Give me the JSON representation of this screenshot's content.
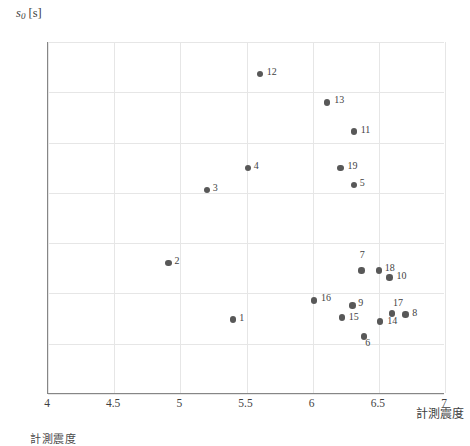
{
  "chart_data": {
    "type": "scatter",
    "title": "",
    "xlabel": "計測震度",
    "ylabel": "s0 [s]",
    "ylabel_symbol": "s",
    "ylabel_subscript": "0",
    "ylabel_unit": "[s]",
    "xlim": [
      4,
      7
    ],
    "ylim": [
      0.0,
      35.0
    ],
    "xticks": [
      "4",
      "4.5",
      "5",
      "5.5",
      "6",
      "6.5",
      "7"
    ],
    "xtick_values": [
      4,
      4.5,
      5,
      5.5,
      6,
      6.5,
      7
    ],
    "yticks": [
      "0.0",
      "5.0",
      "10.0",
      "15.0",
      "20.0",
      "25.0",
      "30.0",
      "35.0"
    ],
    "ytick_values": [
      0,
      5,
      10,
      15,
      20,
      25,
      30,
      35
    ],
    "grid": true,
    "legend": "none",
    "marker_color": "#585858",
    "grid_color": "#e6e6e6",
    "axis_color": "#868686",
    "points": [
      {
        "label": "1",
        "x": 5.4,
        "y": 7.4,
        "lx": 6,
        "ly": -4
      },
      {
        "label": "2",
        "x": 4.91,
        "y": 13.0,
        "lx": 6,
        "ly": -4
      },
      {
        "label": "3",
        "x": 5.2,
        "y": 20.3,
        "lx": 6,
        "ly": -4
      },
      {
        "label": "4",
        "x": 5.51,
        "y": 22.5,
        "lx": 6,
        "ly": -4
      },
      {
        "label": "5",
        "x": 6.31,
        "y": 20.8,
        "lx": 6,
        "ly": -4
      },
      {
        "label": "6",
        "x": 6.39,
        "y": 5.7,
        "lx": 1,
        "ly": 4
      },
      {
        "label": "7",
        "x": 6.37,
        "y": 12.3,
        "lx": -2,
        "ly": -17
      },
      {
        "label": "8",
        "x": 6.7,
        "y": 7.9,
        "lx": 7,
        "ly": -4
      },
      {
        "label": "9",
        "x": 6.3,
        "y": 8.8,
        "lx": 6,
        "ly": -4
      },
      {
        "label": "10",
        "x": 6.58,
        "y": 11.6,
        "lx": 7,
        "ly": -3
      },
      {
        "label": "11",
        "x": 6.31,
        "y": 26.1,
        "lx": 7,
        "ly": -4
      },
      {
        "label": "12",
        "x": 5.6,
        "y": 31.8,
        "lx": 7,
        "ly": -4
      },
      {
        "label": "13",
        "x": 6.11,
        "y": 29.0,
        "lx": 7,
        "ly": -4
      },
      {
        "label": "14",
        "x": 6.51,
        "y": 7.2,
        "lx": 7,
        "ly": -3
      },
      {
        "label": "15",
        "x": 6.22,
        "y": 7.6,
        "lx": 7,
        "ly": -3
      },
      {
        "label": "16",
        "x": 6.01,
        "y": 9.3,
        "lx": 7,
        "ly": -4
      },
      {
        "label": "17",
        "x": 6.6,
        "y": 8.0,
        "lx": 1,
        "ly": -13
      },
      {
        "label": "18",
        "x": 6.5,
        "y": 12.3,
        "lx": 6,
        "ly": -4
      },
      {
        "label": "19",
        "x": 6.21,
        "y": 22.5,
        "lx": 7,
        "ly": -4
      }
    ]
  },
  "caption": {
    "text": "計測震度"
  }
}
